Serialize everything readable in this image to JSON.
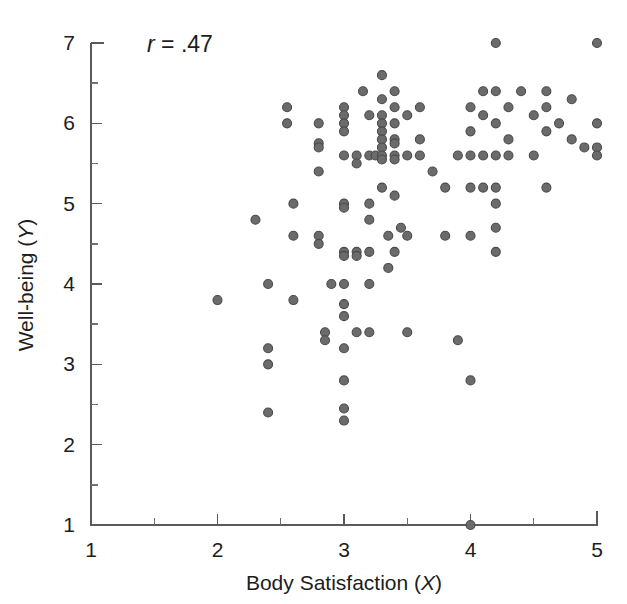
{
  "figure": {
    "background_color": "#ffffff",
    "marker_color": "#6b6b6b",
    "marker_edge_color": "#4a4a4a",
    "axis_color": "#5a5a5a",
    "text_color": "#1d1d1d"
  },
  "annotation": {
    "statistic_symbol": "r",
    "statistic_relation": " = ",
    "statistic_value": ".47",
    "full_text": "r = .47"
  },
  "axes": {
    "x_title_main": "Body Satisfaction (",
    "x_title_var": "X",
    "x_title_close": ")",
    "x_title_full": "Body Satisfaction (X)",
    "y_title_main": "Well-being (",
    "y_title_var": "Y",
    "y_title_close": ")",
    "y_title_full": "Well-being (Y)",
    "x_ticks": [
      "1",
      "2",
      "3",
      "4",
      "5"
    ],
    "y_ticks": [
      "1",
      "2",
      "3",
      "4",
      "5",
      "6",
      "7"
    ]
  },
  "chart_data": {
    "type": "scatter",
    "title": "",
    "xlabel": "Body Satisfaction (X)",
    "ylabel": "Well-being (Y)",
    "xlim": [
      1,
      5
    ],
    "ylim": [
      1,
      7
    ],
    "xticks": [
      1,
      2,
      3,
      4,
      5
    ],
    "yticks": [
      1,
      2,
      3,
      4,
      5,
      6,
      7
    ],
    "x_minor_ticks": [
      1.5,
      2.5,
      3.5,
      4.5
    ],
    "y_minor_ticks": [
      1.5,
      2.5,
      3.5,
      4.5,
      5.5,
      6.5
    ],
    "grid": false,
    "legend": null,
    "annotations": [
      {
        "text": "r = .47",
        "x": 2.1,
        "y": 6.85,
        "italic_prefix": "r"
      }
    ],
    "correlation_r": 0.47,
    "n_points": 121,
    "marker": {
      "shape": "circle",
      "size_px": 9,
      "face_color": "#6b6b6b",
      "edge_color": "#4a4a4a"
    },
    "points": [
      [
        2.0,
        3.8
      ],
      [
        2.3,
        4.8
      ],
      [
        2.4,
        4.0
      ],
      [
        2.4,
        3.2
      ],
      [
        2.4,
        3.0
      ],
      [
        2.4,
        2.4
      ],
      [
        2.55,
        6.2
      ],
      [
        2.55,
        6.0
      ],
      [
        2.6,
        5.0
      ],
      [
        2.6,
        4.6
      ],
      [
        2.6,
        3.8
      ],
      [
        2.8,
        6.0
      ],
      [
        2.8,
        5.75
      ],
      [
        2.8,
        5.7
      ],
      [
        2.8,
        5.4
      ],
      [
        2.8,
        4.6
      ],
      [
        2.8,
        4.5
      ],
      [
        2.85,
        3.4
      ],
      [
        2.85,
        3.3
      ],
      [
        2.9,
        4.0
      ],
      [
        3.0,
        6.2
      ],
      [
        3.0,
        6.1
      ],
      [
        3.0,
        6.0
      ],
      [
        3.0,
        5.9
      ],
      [
        3.0,
        5.6
      ],
      [
        3.0,
        5.0
      ],
      [
        3.0,
        4.95
      ],
      [
        3.0,
        4.4
      ],
      [
        3.0,
        4.35
      ],
      [
        3.0,
        4.0
      ],
      [
        3.0,
        3.75
      ],
      [
        3.0,
        3.6
      ],
      [
        3.0,
        3.2
      ],
      [
        3.0,
        2.8
      ],
      [
        3.0,
        2.45
      ],
      [
        3.0,
        2.3
      ],
      [
        3.1,
        5.6
      ],
      [
        3.1,
        5.5
      ],
      [
        3.1,
        4.4
      ],
      [
        3.1,
        4.35
      ],
      [
        3.1,
        3.4
      ],
      [
        3.15,
        6.4
      ],
      [
        3.2,
        6.1
      ],
      [
        3.2,
        5.6
      ],
      [
        3.2,
        5.0
      ],
      [
        3.2,
        4.8
      ],
      [
        3.2,
        4.4
      ],
      [
        3.2,
        4.0
      ],
      [
        3.2,
        3.4
      ],
      [
        3.25,
        5.6
      ],
      [
        3.3,
        6.6
      ],
      [
        3.3,
        6.3
      ],
      [
        3.3,
        6.1
      ],
      [
        3.3,
        6.0
      ],
      [
        3.3,
        5.9
      ],
      [
        3.3,
        5.8
      ],
      [
        3.3,
        5.7
      ],
      [
        3.3,
        5.6
      ],
      [
        3.3,
        5.55
      ],
      [
        3.3,
        5.2
      ],
      [
        3.35,
        4.6
      ],
      [
        3.35,
        4.2
      ],
      [
        3.4,
        6.4
      ],
      [
        3.4,
        6.2
      ],
      [
        3.4,
        6.0
      ],
      [
        3.4,
        5.8
      ],
      [
        3.4,
        5.75
      ],
      [
        3.4,
        5.6
      ],
      [
        3.4,
        5.55
      ],
      [
        3.4,
        5.1
      ],
      [
        3.4,
        4.4
      ],
      [
        3.45,
        4.7
      ],
      [
        3.5,
        6.1
      ],
      [
        3.5,
        5.6
      ],
      [
        3.5,
        4.6
      ],
      [
        3.5,
        3.4
      ],
      [
        3.6,
        6.2
      ],
      [
        3.6,
        5.8
      ],
      [
        3.6,
        5.6
      ],
      [
        3.7,
        5.4
      ],
      [
        3.8,
        5.2
      ],
      [
        3.8,
        4.6
      ],
      [
        3.9,
        5.6
      ],
      [
        3.9,
        3.3
      ],
      [
        4.0,
        6.2
      ],
      [
        4.0,
        5.9
      ],
      [
        4.0,
        5.6
      ],
      [
        4.0,
        5.2
      ],
      [
        4.0,
        4.6
      ],
      [
        4.0,
        2.8
      ],
      [
        4.0,
        1.0
      ],
      [
        4.1,
        6.4
      ],
      [
        4.1,
        6.1
      ],
      [
        4.1,
        5.6
      ],
      [
        4.1,
        5.2
      ],
      [
        4.2,
        7.0
      ],
      [
        4.2,
        6.4
      ],
      [
        4.2,
        6.0
      ],
      [
        4.2,
        5.6
      ],
      [
        4.2,
        5.2
      ],
      [
        4.2,
        5.0
      ],
      [
        4.2,
        4.7
      ],
      [
        4.2,
        4.4
      ],
      [
        4.3,
        6.2
      ],
      [
        4.3,
        5.8
      ],
      [
        4.3,
        5.6
      ],
      [
        4.4,
        6.4
      ],
      [
        4.5,
        6.1
      ],
      [
        4.5,
        5.6
      ],
      [
        4.6,
        6.4
      ],
      [
        4.6,
        6.2
      ],
      [
        4.6,
        5.9
      ],
      [
        4.6,
        5.2
      ],
      [
        4.7,
        6.0
      ],
      [
        4.8,
        6.3
      ],
      [
        4.8,
        5.8
      ],
      [
        4.9,
        5.7
      ],
      [
        5.0,
        7.0
      ],
      [
        5.0,
        6.0
      ],
      [
        5.0,
        5.7
      ],
      [
        5.0,
        5.6
      ]
    ]
  }
}
